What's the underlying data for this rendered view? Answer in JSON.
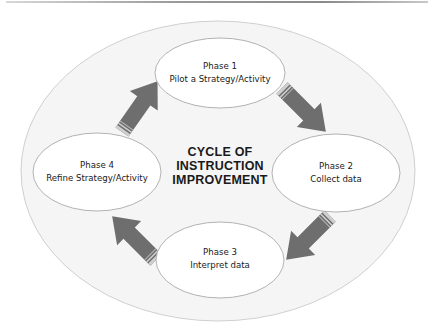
{
  "diagram": {
    "title_lines": [
      "CYCLE OF",
      "INSTRUCTION",
      "IMPROVEMENT"
    ],
    "phases": [
      {
        "phase": "Phase 1",
        "label": "Pilot a Strategy/Activity"
      },
      {
        "phase": "Phase 2",
        "label": "Collect data"
      },
      {
        "phase": "Phase 3",
        "label": "Interpret data"
      },
      {
        "phase": "Phase 4",
        "label": "Refine Strategy/Activity"
      }
    ],
    "arrows": [
      {
        "from": "Phase 1",
        "to": "Phase 2"
      },
      {
        "from": "Phase 2",
        "to": "Phase 3"
      },
      {
        "from": "Phase 3",
        "to": "Phase 4"
      },
      {
        "from": "Phase 4",
        "to": "Phase 1"
      }
    ],
    "colors": {
      "arrow_fill": "#6e6e6e",
      "ellipse_stroke": "#a0a0a0",
      "outer_fill": "#f4f4f4",
      "text": "#1a1a1a"
    }
  }
}
